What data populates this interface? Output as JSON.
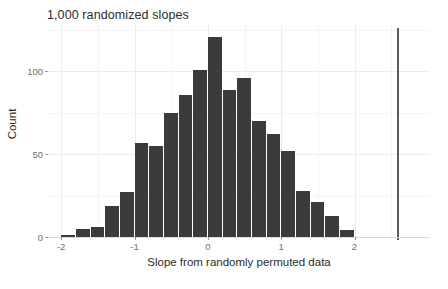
{
  "chart_data": {
    "type": "bar",
    "title": "1,000 randomized slopes",
    "xlabel": "Slope from randomly permuted data",
    "ylabel": "Count",
    "xlim": [
      -2.18,
      3.03
    ],
    "ylim": [
      0,
      128
    ],
    "grid": true,
    "legend": null,
    "bin_width": 0.2,
    "bar_color": "#3b3b3b",
    "categories": [
      "-2.0",
      "-1.8",
      "-1.6",
      "-1.4",
      "-1.2",
      "-1.0",
      "-0.8",
      "-0.6",
      "-0.4",
      "-0.2",
      "0.0",
      "0.2",
      "0.4",
      "0.6",
      "0.8",
      "1.0",
      "1.2",
      "1.4",
      "1.6",
      "1.8"
    ],
    "bin_starts": [
      -2.0,
      -1.8,
      -1.6,
      -1.4,
      -1.2,
      -1.0,
      -0.8,
      -0.6,
      -0.4,
      -0.2,
      0.0,
      0.2,
      0.4,
      0.6,
      0.8,
      1.0,
      1.2,
      1.4,
      1.6,
      1.8
    ],
    "values": [
      1,
      5,
      6,
      19,
      27,
      57,
      55,
      75,
      86,
      101,
      121,
      89,
      96,
      70,
      62,
      52,
      28,
      21,
      13,
      4
    ],
    "x_ticks": [
      -2,
      -1,
      0,
      1,
      2
    ],
    "x_tick_labels": [
      "-2",
      "-1",
      "0",
      "1",
      "2"
    ],
    "x_minor_ticks": [
      -1.5,
      -0.5,
      0.5,
      1.5,
      2.5
    ],
    "y_ticks": [
      0,
      50,
      100
    ],
    "y_tick_labels": [
      "0",
      "50",
      "100"
    ],
    "y_minor_ticks": [
      25,
      75,
      125
    ],
    "annotations": [
      {
        "name": "observed-slope-line",
        "type": "vline",
        "x": 2.58,
        "color": "#5a5a66"
      }
    ]
  }
}
